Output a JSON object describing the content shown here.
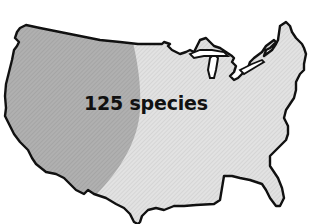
{
  "map": {
    "label": "125 species",
    "region": "contiguous-united-states",
    "colors": {
      "outline": "#111111",
      "range_fill": "#a9a9a9",
      "land_fill": "#dcdcdc",
      "background": "#ffffff"
    }
  }
}
